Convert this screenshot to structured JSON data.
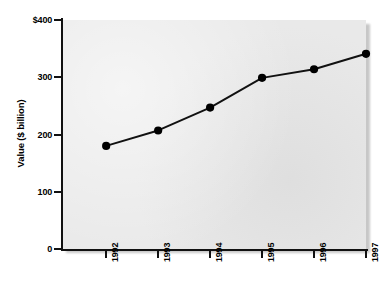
{
  "chart_data": {
    "type": "line",
    "title": "",
    "subtitle": "",
    "xlabel": "",
    "ylabel": "Value ($ billion)",
    "categories": [
      "1992",
      "1993",
      "1994",
      "1995",
      "1996",
      "1997"
    ],
    "values": [
      180,
      207,
      247,
      299,
      314,
      341
    ],
    "series": [
      {
        "name": "Value",
        "values": [
          180,
          207,
          247,
          299,
          314,
          341
        ]
      }
    ],
    "ylim": [
      0,
      400
    ],
    "yticks": [
      0,
      100,
      200,
      300,
      400
    ],
    "ytick_labels": [
      "0",
      "100",
      "200",
      "300",
      "$400"
    ],
    "xtick_labels": [
      "1992",
      "1993",
      "1994",
      "1995",
      "1996",
      "1997"
    ],
    "grid": false,
    "legend": false,
    "legend_position": "none",
    "marker": "filled-circle",
    "colors": {
      "line": "#111111",
      "marker": "#000000",
      "plot_background": "#e9e9e9",
      "page_background": "#ffffff",
      "axis": "#111111",
      "text": "#000000"
    }
  },
  "axis": {
    "y_title": "Value ($ billion)",
    "y_ticks": [
      {
        "label": "$400",
        "value": 400
      },
      {
        "label": "300",
        "value": 300
      },
      {
        "label": "200",
        "value": 200
      },
      {
        "label": "100",
        "value": 100
      },
      {
        "label": "0",
        "value": 0
      }
    ],
    "x_ticks": [
      {
        "label": "1992"
      },
      {
        "label": "1993"
      },
      {
        "label": "1994"
      },
      {
        "label": "1995"
      },
      {
        "label": "1996"
      },
      {
        "label": "1997"
      }
    ]
  }
}
